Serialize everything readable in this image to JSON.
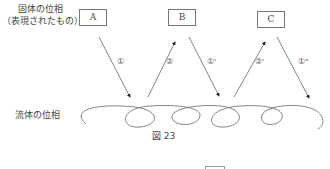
{
  "labels": {
    "solid_phase_line1": "固体の位相",
    "solid_phase_line2": "（表現されたもの）",
    "fluid_phase": "流体の位相"
  },
  "boxes": [
    "A",
    "B",
    "C"
  ],
  "arrows": [
    {
      "from": "A",
      "to": "fluid",
      "label": "①"
    },
    {
      "from": "fluid",
      "to": "B",
      "label": "②"
    },
    {
      "from": "B",
      "to": "fluid",
      "label": "①'"
    },
    {
      "from": "fluid",
      "to": "C",
      "label": "②'"
    },
    {
      "from": "C",
      "to": "fluid",
      "label": "①\""
    }
  ],
  "caption": "図 23"
}
